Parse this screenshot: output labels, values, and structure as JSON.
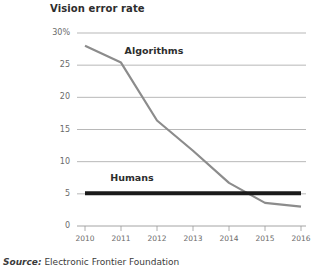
{
  "chart_data": {
    "type": "line",
    "title": "Vision error rate",
    "xlabel": "",
    "ylabel": "",
    "xlim": [
      2010,
      2016
    ],
    "ylim": [
      0,
      30
    ],
    "grid": true,
    "legend_position": "inline-labels",
    "x": [
      2010,
      2011,
      2012,
      2013,
      2014,
      2015,
      2016
    ],
    "xtick_labels": [
      "2010",
      "2011",
      "2012",
      "2013",
      "2014",
      "2015",
      "2016"
    ],
    "ytick_labels": [
      "30%",
      "25",
      "20",
      "15",
      "10",
      "5",
      "0"
    ],
    "ytick_values": [
      30,
      25,
      20,
      15,
      10,
      5,
      0
    ],
    "series": [
      {
        "name": "Algorithms",
        "color": "#8c8c8c",
        "width": 2.2,
        "values": [
          28.0,
          25.4,
          16.4,
          11.7,
          6.7,
          3.6,
          3.0
        ]
      },
      {
        "name": "Humans",
        "color": "#1a1a1a",
        "width": 4.0,
        "values": [
          5.1,
          5.1,
          5.1,
          5.1,
          5.1,
          5.1,
          5.1
        ]
      }
    ],
    "annotations": [
      {
        "text": "Algorithms",
        "x": 2011.1,
        "y": 27.2
      },
      {
        "text": "Humans",
        "x": 2010.7,
        "y": 7.4
      }
    ]
  },
  "source": {
    "prefix": "Source:",
    "text": " Electronic Frontier Foundation"
  },
  "colors": {
    "background": "#ffffff",
    "gridline": "#9a9a9a",
    "axis": "#9a9a9a",
    "tick_text": "#6a6a6a",
    "title_text": "#2d2d2d",
    "algorithms": "#8c8c8c",
    "humans": "#1a1a1a"
  }
}
